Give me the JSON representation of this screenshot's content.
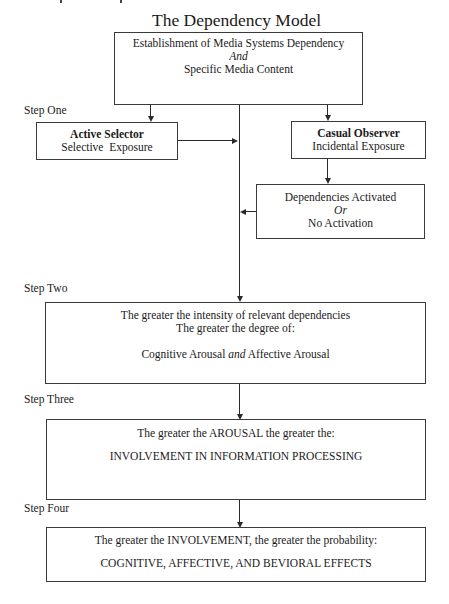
{
  "diagram": {
    "title": "The Dependency Model",
    "top_box": {
      "line1": "Establishment of Media Systems Dependency",
      "line2": "And",
      "line3": "Specific Media Content"
    },
    "steps": {
      "one": "Step One",
      "two": "Step Two",
      "three": "Step Three",
      "four": "Step Four"
    },
    "active_selector": {
      "heading": "Active Selector",
      "sub": "Selective  Exposure"
    },
    "casual_observer": {
      "heading": "Casual Observer",
      "sub": "Incidental Exposure"
    },
    "dependencies_box": {
      "line1": "Dependencies Activated",
      "line2": "Or",
      "line3": "No Activation"
    },
    "step_two_box": {
      "line1": "The greater the intensity of relevant dependencies",
      "line2": "The greater the degree of:",
      "line3_a": "Cognitive Arousal ",
      "line3_b": "and",
      "line3_c": " Affective Arousal"
    },
    "step_three_box": {
      "line1": "The greater the AROUSAL the greater the:",
      "line2": "INVOLVEMENT IN INFORMATION PROCESSING"
    },
    "step_four_box": {
      "line1": "The greater the INVOLVEMENT, the greater the probability:",
      "line2": "COGNITIVE, AFFECTIVE, AND BEVIORAL EFFECTS"
    }
  }
}
